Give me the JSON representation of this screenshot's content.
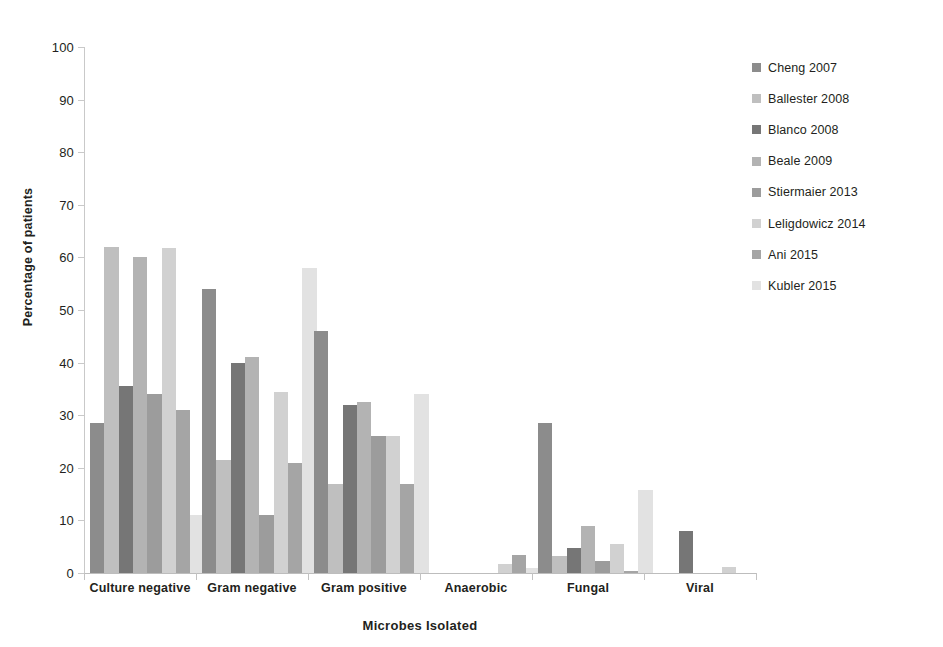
{
  "chart_data": {
    "type": "bar",
    "title": "",
    "xlabel": "Microbes Isolated",
    "ylabel": "Percentage of patients",
    "ylim": [
      0,
      100
    ],
    "yticks": [
      0,
      10,
      20,
      30,
      40,
      50,
      60,
      70,
      80,
      90,
      100
    ],
    "ytick_labels": [
      "0",
      "10",
      "20",
      "30",
      "40",
      "50",
      "60",
      "70",
      "80",
      "90",
      "100"
    ],
    "grid": false,
    "legend_position": "right",
    "categories": [
      "Culture negative",
      "Gram negative",
      "Gram positive",
      "Anaerobic",
      "Fungal",
      "Viral"
    ],
    "series": [
      {
        "name": "Cheng 2007",
        "color": "#8c8c8c",
        "values": [
          28.5,
          54,
          46,
          0,
          28.5,
          0
        ]
      },
      {
        "name": "Ballester 2008",
        "color": "#bfbfbf",
        "values": [
          62,
          21.5,
          17,
          0,
          3.3,
          0
        ]
      },
      {
        "name": "Blanco 2008",
        "color": "#767676",
        "values": [
          35.5,
          40,
          32,
          0,
          4.8,
          8
        ]
      },
      {
        "name": "Beale 2009",
        "color": "#b3b3b3",
        "values": [
          60,
          41,
          32.5,
          0,
          9,
          0
        ]
      },
      {
        "name": "Stiermaier 2013",
        "color": "#9c9c9c",
        "values": [
          34,
          11,
          26,
          0,
          2.2,
          0
        ]
      },
      {
        "name": "Leligdowicz 2014",
        "color": "#d1d1d1",
        "values": [
          61.8,
          34.5,
          26,
          1.8,
          5.6,
          1.2
        ]
      },
      {
        "name": "Ani 2015",
        "color": "#a5a5a5",
        "values": [
          31,
          21,
          17,
          3.4,
          0.4,
          0
        ]
      },
      {
        "name": "Kubler 2015",
        "color": "#e2e2e2",
        "values": [
          11,
          58,
          34,
          0.9,
          15.8,
          0
        ]
      }
    ]
  }
}
